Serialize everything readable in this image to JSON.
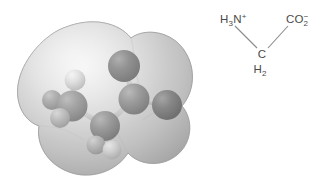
{
  "figure": {
    "background_color": "#ffffff",
    "width": 325,
    "height": 196
  },
  "model": {
    "name": "space-filling-electron-density-model",
    "description": "Ball-and-stick model of glycine zwitterion enclosed in a translucent gray electron-density surface",
    "surface": {
      "label": "electron-density-surface",
      "fill_color": "#c8c8c8",
      "highlight_color": "#ededed",
      "shadow_color": "#9a9a9a",
      "opacity": 0.82
    },
    "atoms": [
      {
        "element": "N",
        "label": "nitrogen",
        "x": 72,
        "y": 106,
        "r": 15.5,
        "color": "#6e6e6e",
        "highlight": "#9d9d9d"
      },
      {
        "element": "H",
        "label": "hydrogen-n1",
        "x": 75,
        "y": 80,
        "r": 10.5,
        "color": "#c9c9c9",
        "highlight": "#f0f0f0"
      },
      {
        "element": "H",
        "label": "hydrogen-n2",
        "x": 52,
        "y": 100,
        "r": 10.0,
        "color": "#8e8e8e",
        "highlight": "#b8b8b8"
      },
      {
        "element": "H",
        "label": "hydrogen-n3",
        "x": 60,
        "y": 118,
        "r": 10.0,
        "color": "#a8a8a8",
        "highlight": "#d4d4d4"
      },
      {
        "element": "C",
        "label": "carbon-alpha",
        "x": 105,
        "y": 126,
        "r": 15.0,
        "color": "#6a6a6a",
        "highlight": "#9a9a9a"
      },
      {
        "element": "H",
        "label": "hydrogen-c1",
        "x": 96,
        "y": 145,
        "r": 9.5,
        "color": "#b4b4b4",
        "highlight": "#e2e2e2"
      },
      {
        "element": "H",
        "label": "hydrogen-c2",
        "x": 112,
        "y": 150,
        "r": 9.5,
        "color": "#c6c6c6",
        "highlight": "#eeeeee"
      },
      {
        "element": "C",
        "label": "carbon-carboxyl",
        "x": 134,
        "y": 99,
        "r": 15.5,
        "color": "#6a6a6a",
        "highlight": "#9a9a9a"
      },
      {
        "element": "O",
        "label": "oxygen-1",
        "x": 124,
        "y": 66,
        "r": 16.0,
        "color": "#545454",
        "highlight": "#848484"
      },
      {
        "element": "O",
        "label": "oxygen-2",
        "x": 167,
        "y": 105,
        "r": 15.0,
        "color": "#585858",
        "highlight": "#888888"
      }
    ],
    "bonds": [
      {
        "label": "bond-n-h1",
        "from": "N",
        "to": "hydrogen-n1"
      },
      {
        "label": "bond-n-h2",
        "from": "N",
        "to": "hydrogen-n2"
      },
      {
        "label": "bond-n-h3",
        "from": "N",
        "to": "hydrogen-n3"
      },
      {
        "label": "bond-n-ca",
        "from": "N",
        "to": "carbon-alpha"
      },
      {
        "label": "bond-ca-h1",
        "from": "carbon-alpha",
        "to": "hydrogen-c1"
      },
      {
        "label": "bond-ca-h2",
        "from": "carbon-alpha",
        "to": "hydrogen-c2"
      },
      {
        "label": "bond-ca-cc",
        "from": "carbon-alpha",
        "to": "carbon-carboxyl"
      },
      {
        "label": "bond-cc-o1",
        "from": "carbon-carboxyl",
        "to": "oxygen-1"
      },
      {
        "label": "bond-cc-o2",
        "from": "carbon-carboxyl",
        "to": "oxygen-2"
      }
    ]
  },
  "formula": {
    "name": "skeletal-formula-glycine-zwitterion",
    "text_color": "#4a4a4a",
    "bond_color": "#8a8a8a",
    "groups": [
      {
        "id": "amino",
        "label": "ammonium-group",
        "main": "H",
        "sub": "3",
        "element": "N",
        "charge": "+",
        "full_text": "H3N+"
      },
      {
        "id": "methylene",
        "label": "methylene-group",
        "main": "C",
        "second_main": "H",
        "second_sub": "2",
        "full_text": "CH2"
      },
      {
        "id": "carboxylate",
        "label": "carboxylate-group",
        "main": "CO",
        "sub": "2",
        "charge": "−",
        "full_text": "CO2-"
      }
    ]
  }
}
